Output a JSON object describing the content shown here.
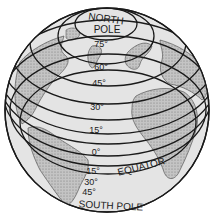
{
  "diagram": {
    "north_pole_label": [
      "NORTH",
      "POLE"
    ],
    "south_pole_label": "SOUTH POLE",
    "equator_label": "EQUATOR",
    "latitude_labels": {
      "n75": "75°",
      "n60": "60°",
      "n45": "45°",
      "n30": "30°",
      "n15": "15°",
      "eq": "0°",
      "s15": "15°",
      "s30": "30°",
      "s45": "45°"
    },
    "colors": {
      "ocean": "#e2e2e2",
      "land": "#bdbdbd",
      "line": "#1a1a1a",
      "background": "#ffffff"
    }
  }
}
